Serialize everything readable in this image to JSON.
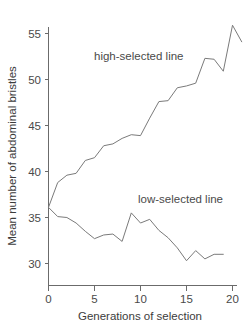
{
  "chart_data": {
    "type": "line",
    "title": "",
    "xlabel": "Generations of selection",
    "ylabel": "Mean number of abdominal bristles",
    "xlim": [
      0,
      21
    ],
    "ylim": [
      28,
      57
    ],
    "xticks": [
      0,
      5,
      10,
      15,
      20
    ],
    "xtick_labels": [
      "0",
      "5",
      "10",
      "15",
      "20"
    ],
    "yticks": [
      30,
      35,
      40,
      45,
      50,
      55
    ],
    "ytick_labels": [
      "30",
      "35",
      "40",
      "45",
      "50",
      "55"
    ],
    "grid": false,
    "legend": "inline-annotations",
    "line_color": "#7a7a7a",
    "axis_color": "#6b6b6b",
    "text_color": "#4a4a4a",
    "background": "#ffffff",
    "annotations": [
      {
        "name": "high-selected line",
        "text": "high-selected line",
        "x": 5.0,
        "y": 52.3
      },
      {
        "name": "low-selected line",
        "text": "low-selected line",
        "x": 11.6,
        "y": 36.3
      }
    ],
    "series": [
      {
        "name": "high-selected line",
        "label": "high-selected line",
        "x": [
          0,
          1,
          2,
          3,
          4,
          5,
          6,
          7,
          8,
          9,
          10,
          11,
          12,
          13,
          14,
          15,
          16,
          17,
          18,
          19,
          20,
          21
        ],
        "values": [
          36.1,
          38.8,
          39.6,
          39.8,
          41.2,
          41.5,
          42.8,
          43.0,
          43.6,
          44.0,
          43.9,
          45.8,
          47.6,
          47.7,
          49.1,
          49.3,
          49.6,
          52.3,
          52.2,
          50.9,
          55.9,
          54.1
        ]
      },
      {
        "name": "low-selected line",
        "label": "low-selected line",
        "x": [
          0,
          1,
          2,
          3,
          4,
          5,
          6,
          7,
          8,
          9,
          10,
          11,
          12,
          13,
          14,
          15,
          16,
          17,
          18,
          19
        ],
        "values": [
          36.1,
          35.1,
          35.0,
          34.4,
          33.5,
          32.7,
          33.1,
          33.2,
          32.4,
          35.5,
          34.4,
          34.8,
          33.6,
          32.8,
          31.7,
          30.3,
          31.4,
          30.5,
          31.0,
          31.0
        ]
      }
    ]
  },
  "axes": {
    "y_title": "Mean number of abdominal bristles",
    "x_title": "Generations of selection"
  }
}
